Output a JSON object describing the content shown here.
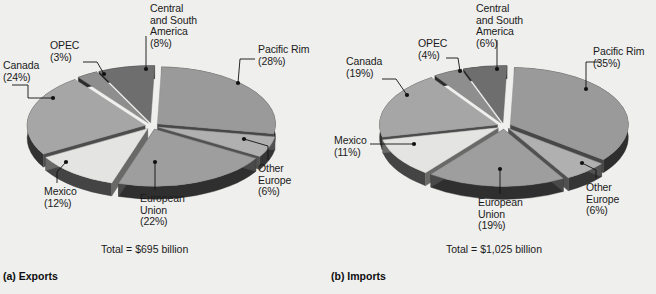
{
  "figure": {
    "background_color": "#efefed",
    "text_color": "#1b1b1b"
  },
  "panels": [
    {
      "id": "exports",
      "caption": "(a) Exports",
      "total": "Total = $695 billion",
      "labels": {
        "canada": "Canada\n(24%)",
        "opec": "OPEC\n(3%)",
        "central_south_america": "Central\nand South\nAmerica\n(8%)",
        "pacific_rim": "Pacific Rim\n(28%)",
        "other_europe": "Other\nEurope\n(6%)",
        "european_union": "European\nUnion\n(22%)",
        "mexico": "Mexico\n(12%)"
      }
    },
    {
      "id": "imports",
      "caption": "(b) Imports",
      "total": "Total = $1,025 billion",
      "labels": {
        "canada": "Canada\n(19%)",
        "opec": "OPEC\n(4%)",
        "central_south_america": "Central\nand South\nAmerica\n(6%)",
        "pacific_rim": "Pacific Rim\n(35%)",
        "other_europe": "Other\nEurope\n(6%)",
        "european_union": "European\nUnion\n(19%)",
        "mexico": "Mexico\n(11%)"
      }
    }
  ],
  "chart_data": [
    {
      "type": "pie",
      "title": "(a) Exports",
      "subtitle": "Total = $695 billion",
      "total_label": "Total = $695 billion",
      "total_value": 695,
      "total_units": "billion USD",
      "exploded": true,
      "three_d": true,
      "legend": "callout-labels",
      "categories": [
        "Pacific Rim",
        "Other Europe",
        "European Union",
        "Mexico",
        "Canada",
        "OPEC",
        "Central and South America"
      ],
      "values": [
        28,
        6,
        22,
        12,
        24,
        3,
        8
      ],
      "labels": [
        "Pacific Rim (28%)",
        "Other Europe (6%)",
        "European Union (22%)",
        "Mexico (12%)",
        "Canada (24%)",
        "OPEC (3%)",
        "Central and South America (8%)"
      ],
      "colors": [
        "#9a9a9a",
        "#b0b0b0",
        "#9e9e9e",
        "#e4e4e2",
        "#a6a6a6",
        "#8e8e8e",
        "#6e6e6e"
      ],
      "units": "percent"
    },
    {
      "type": "pie",
      "title": "(b) Imports",
      "subtitle": "Total = $1,025 billion",
      "total_label": "Total = $1,025 billion",
      "total_value": 1025,
      "total_units": "billion USD",
      "exploded": true,
      "three_d": true,
      "legend": "callout-labels",
      "categories": [
        "Pacific Rim",
        "Other Europe",
        "European Union",
        "Mexico",
        "Canada",
        "OPEC",
        "Central and South America"
      ],
      "values": [
        35,
        6,
        19,
        11,
        19,
        4,
        6
      ],
      "labels": [
        "Pacific Rim (35%)",
        "Other Europe (6%)",
        "European Union (19%)",
        "Mexico (11%)",
        "Canada (19%)",
        "OPEC (4%)",
        "Central and South America (6%)"
      ],
      "colors": [
        "#9a9a9a",
        "#b0b0b0",
        "#9e9e9e",
        "#e4e4e2",
        "#a6a6a6",
        "#8e8e8e",
        "#6e6e6e"
      ],
      "units": "percent"
    }
  ]
}
